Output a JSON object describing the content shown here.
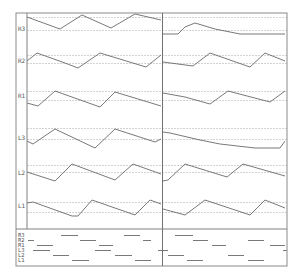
{
  "chart_data": {
    "type": "line",
    "title": "",
    "xlabel": "",
    "ylabel": "",
    "grid": true,
    "panels": [
      "left",
      "right"
    ],
    "colors": {
      "trace": "#6a6a6a",
      "grid": "#c8c8c8",
      "frame": "#808080",
      "divider": "#707070"
    },
    "lanes": [
      {
        "name": "R3",
        "label_y": 29,
        "grid": [
          17,
          30
        ],
        "left": [
          [
            27,
            17
          ],
          [
            60,
            29
          ],
          [
            82,
            15
          ],
          [
            111,
            28
          ],
          [
            135,
            14
          ],
          [
            161,
            20
          ]
        ],
        "right": [
          [
            163,
            34
          ],
          [
            178,
            34
          ],
          [
            185,
            27
          ],
          [
            195,
            23
          ],
          [
            215,
            29
          ],
          [
            240,
            34
          ],
          [
            285,
            34
          ]
        ]
      },
      {
        "name": "R2",
        "label_y": 61,
        "grid": [
          55,
          63
        ],
        "left": [
          [
            27,
            61
          ],
          [
            37,
            53
          ],
          [
            65,
            63
          ],
          [
            78,
            68
          ],
          [
            100,
            53
          ],
          [
            146,
            67
          ],
          [
            161,
            55
          ]
        ],
        "right": [
          [
            163,
            62
          ],
          [
            193,
            66
          ],
          [
            210,
            53
          ],
          [
            250,
            67
          ],
          [
            265,
            53
          ],
          [
            285,
            61
          ]
        ]
      },
      {
        "name": "R1",
        "label_y": 96,
        "grid": [
          91,
          100
        ],
        "left": [
          [
            27,
            103
          ],
          [
            38,
            106
          ],
          [
            55,
            91
          ],
          [
            100,
            107
          ],
          [
            115,
            92
          ],
          [
            161,
            106
          ]
        ],
        "right": [
          [
            163,
            93
          ],
          [
            185,
            97
          ],
          [
            210,
            104
          ],
          [
            228,
            91
          ],
          [
            270,
            102
          ],
          [
            285,
            91
          ]
        ]
      },
      {
        "name": "L3",
        "label_y": 138,
        "grid": [
          128,
          139
        ],
        "left": [
          [
            27,
            141
          ],
          [
            33,
            144
          ],
          [
            55,
            129
          ],
          [
            95,
            148
          ],
          [
            115,
            129
          ],
          [
            155,
            142
          ],
          [
            161,
            139
          ]
        ],
        "right": [
          [
            163,
            132
          ],
          [
            170,
            133
          ],
          [
            200,
            140
          ],
          [
            220,
            144
          ],
          [
            255,
            148
          ],
          [
            280,
            148
          ],
          [
            285,
            141
          ]
        ]
      },
      {
        "name": "L2",
        "label_y": 173,
        "grid": [
          165,
          172
        ],
        "left": [
          [
            27,
            172
          ],
          [
            55,
            181
          ],
          [
            72,
            164
          ],
          [
            115,
            180
          ],
          [
            133,
            164
          ],
          [
            161,
            174
          ]
        ],
        "right": [
          [
            163,
            181
          ],
          [
            168,
            180
          ],
          [
            185,
            164
          ],
          [
            227,
            177
          ],
          [
            243,
            164
          ],
          [
            285,
            176
          ]
        ]
      },
      {
        "name": "L1",
        "label_y": 206,
        "grid": [
          202,
          212
        ],
        "left": [
          [
            27,
            203
          ],
          [
            33,
            202
          ],
          [
            72,
            216
          ],
          [
            78,
            216
          ],
          [
            92,
            200
          ],
          [
            135,
            215
          ],
          [
            150,
            200
          ],
          [
            161,
            204
          ]
        ],
        "right": [
          [
            163,
            209
          ],
          [
            185,
            215
          ],
          [
            205,
            200
          ],
          [
            250,
            215
          ],
          [
            265,
            200
          ],
          [
            285,
            208
          ]
        ]
      }
    ],
    "overview": {
      "labels": [
        "R3",
        "R2",
        "R1",
        "L3",
        "L2",
        "L1"
      ],
      "segments": [
        {
          "lane": "R3",
          "y": 235,
          "x": [
            [
              61,
              78
            ],
            [
              124,
              140
            ],
            [
              175,
              193
            ]
          ]
        },
        {
          "lane": "R2",
          "y": 240,
          "x": [
            [
              28,
              34
            ],
            [
              80,
              96
            ],
            [
              143,
              151
            ],
            [
              193,
              208
            ],
            [
              248,
              264
            ]
          ]
        },
        {
          "lane": "R1",
          "y": 245,
          "x": [
            [
              37,
              53
            ],
            [
              99,
              113
            ],
            [
              212,
              226
            ],
            [
              270,
              285
            ]
          ]
        },
        {
          "lane": "L3",
          "y": 250,
          "x": [
            [
              33,
              50
            ],
            [
              95,
              111
            ],
            [
              158,
              168
            ],
            [
              283,
              287
            ]
          ]
        },
        {
          "lane": "L2",
          "y": 255,
          "x": [
            [
              53,
              69
            ],
            [
              115,
              132
            ],
            [
              168,
              184
            ],
            [
              228,
              244
            ]
          ]
        },
        {
          "lane": "L1",
          "y": 260,
          "x": [
            [
              72,
              89
            ],
            [
              135,
              151
            ],
            [
              187,
              203
            ],
            [
              248,
              264
            ]
          ]
        }
      ]
    }
  }
}
